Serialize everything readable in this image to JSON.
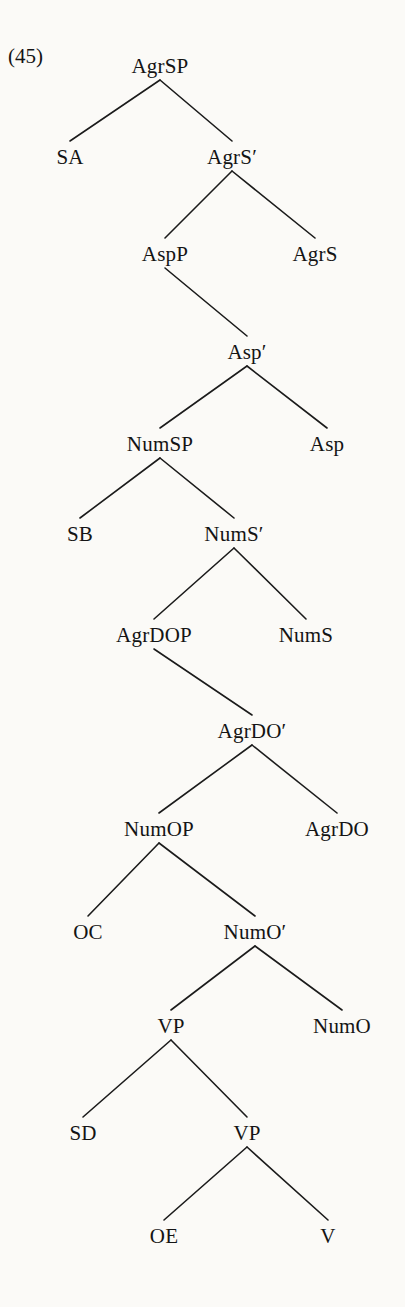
{
  "figure": {
    "example_number": "(45)",
    "example_number_x": 8,
    "example_number_y": 56,
    "type": "syntactic-constituency-tree",
    "ink_color": "#141414",
    "background_color": "#fbfaf7",
    "width": 405,
    "height": 1307
  },
  "nodes": [
    {
      "id": "AgrSP",
      "label": "AgrSP",
      "x": 160,
      "y": 66,
      "level": 0
    },
    {
      "id": "SA",
      "label": "SA",
      "x": 70,
      "y": 157,
      "level": 1
    },
    {
      "id": "AgrSbar",
      "label": "AgrS′",
      "x": 232,
      "y": 157,
      "level": 1
    },
    {
      "id": "AspP",
      "label": "AspP",
      "x": 165,
      "y": 254,
      "level": 2
    },
    {
      "id": "AgrS",
      "label": "AgrS",
      "x": 315,
      "y": 254,
      "level": 2
    },
    {
      "id": "Aspbar",
      "label": "Asp′",
      "x": 247,
      "y": 352,
      "level": 3
    },
    {
      "id": "NumSP",
      "label": "NumSP",
      "x": 160,
      "y": 444,
      "level": 4
    },
    {
      "id": "Asp",
      "label": "Asp",
      "x": 327,
      "y": 444,
      "level": 4
    },
    {
      "id": "SB",
      "label": "SB",
      "x": 80,
      "y": 534,
      "level": 5
    },
    {
      "id": "NumSbar",
      "label": "NumS′",
      "x": 234,
      "y": 534,
      "level": 5
    },
    {
      "id": "AgrDOP",
      "label": "AgrDOP",
      "x": 154,
      "y": 635,
      "level": 6
    },
    {
      "id": "NumS",
      "label": "NumS",
      "x": 306,
      "y": 635,
      "level": 6
    },
    {
      "id": "AgrDObar",
      "label": "AgrDO′",
      "x": 252,
      "y": 731,
      "level": 7
    },
    {
      "id": "NumOP",
      "label": "NumOP",
      "x": 159,
      "y": 829,
      "level": 8
    },
    {
      "id": "AgrDO",
      "label": "AgrDO",
      "x": 337,
      "y": 829,
      "level": 8
    },
    {
      "id": "OC",
      "label": "OC",
      "x": 88,
      "y": 932,
      "level": 9
    },
    {
      "id": "NumObar",
      "label": "NumO′",
      "x": 255,
      "y": 932,
      "level": 9
    },
    {
      "id": "VP1",
      "label": "VP",
      "x": 171,
      "y": 1026,
      "level": 10
    },
    {
      "id": "NumO",
      "label": "NumO",
      "x": 342,
      "y": 1026,
      "level": 10
    },
    {
      "id": "SD",
      "label": "SD",
      "x": 83,
      "y": 1133,
      "level": 11
    },
    {
      "id": "VP2",
      "label": "VP",
      "x": 247,
      "y": 1133,
      "level": 11
    },
    {
      "id": "OE",
      "label": "OE",
      "x": 164,
      "y": 1236,
      "level": 12
    },
    {
      "id": "V",
      "label": "V",
      "x": 328,
      "y": 1236,
      "level": 12
    }
  ],
  "edges": [
    {
      "from": "AgrSP",
      "to": "SA"
    },
    {
      "from": "AgrSP",
      "to": "AgrSbar"
    },
    {
      "from": "AgrSbar",
      "to": "AspP"
    },
    {
      "from": "AgrSbar",
      "to": "AgrS"
    },
    {
      "from": "AspP",
      "to": "Aspbar"
    },
    {
      "from": "Aspbar",
      "to": "NumSP"
    },
    {
      "from": "Aspbar",
      "to": "Asp"
    },
    {
      "from": "NumSP",
      "to": "SB"
    },
    {
      "from": "NumSP",
      "to": "NumSbar"
    },
    {
      "from": "NumSbar",
      "to": "AgrDOP"
    },
    {
      "from": "NumSbar",
      "to": "NumS"
    },
    {
      "from": "AgrDOP",
      "to": "AgrDObar"
    },
    {
      "from": "AgrDObar",
      "to": "NumOP"
    },
    {
      "from": "AgrDObar",
      "to": "AgrDO"
    },
    {
      "from": "NumOP",
      "to": "OC"
    },
    {
      "from": "NumOP",
      "to": "NumObar"
    },
    {
      "from": "NumObar",
      "to": "VP1"
    },
    {
      "from": "NumObar",
      "to": "NumO"
    },
    {
      "from": "VP1",
      "to": "SD"
    },
    {
      "from": "VP1",
      "to": "VP2"
    },
    {
      "from": "VP2",
      "to": "OE"
    },
    {
      "from": "VP2",
      "to": "V"
    }
  ],
  "edge_style": {
    "stroke": "#1b1b1b",
    "stroke_width": 1.6,
    "parent_gap": 14,
    "child_gap": 16
  }
}
